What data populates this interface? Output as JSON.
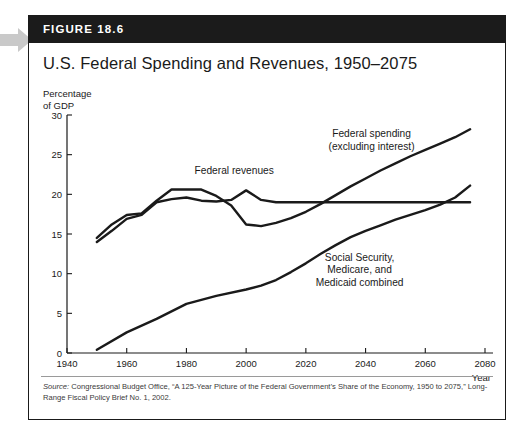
{
  "figure": {
    "badge": "FIGURE 18.6",
    "title": "U.S. Federal Spending and Revenues, 1950–2075",
    "unit_line1": "Percentage",
    "unit_line2": "of GDP",
    "source_prefix": "Source:",
    "source_rest": " Congressional Budget Office, “A 125-Year Picture of the Federal Government’s Share of the Economy, 1950 to 2075,” Long-Range Fiscal Policy Brief No. 1, 2002."
  },
  "chart_data": {
    "type": "line",
    "title": "U.S. Federal Spending and Revenues, 1950–2075",
    "xlabel": "Year",
    "ylabel": "Percentage of GDP",
    "xlim": [
      1940,
      2080
    ],
    "ylim": [
      0,
      30
    ],
    "xticks": [
      1940,
      1960,
      1980,
      2000,
      2020,
      2040,
      2060,
      2080
    ],
    "yticks": [
      0,
      5,
      10,
      15,
      20,
      25,
      30
    ],
    "grid": false,
    "legend": "annotations-on-plot",
    "line_color": "#1a1a1a",
    "series": [
      {
        "name": "Federal spending (excluding interest)",
        "label_line1": "Federal spending",
        "label_line2": "(excluding interest)",
        "label_x": 2042,
        "label_y": 27.2,
        "x": [
          1950,
          1955,
          1960,
          1965,
          1970,
          1975,
          1980,
          1985,
          1990,
          1995,
          2000,
          2005,
          2010,
          2015,
          2020,
          2025,
          2030,
          2035,
          2040,
          2045,
          2050,
          2055,
          2060,
          2065,
          2070,
          2075
        ],
        "y": [
          14.5,
          16.2,
          17.4,
          17.6,
          19.2,
          20.6,
          20.6,
          20.6,
          19.8,
          18.6,
          16.2,
          16.0,
          16.4,
          17.0,
          17.8,
          18.8,
          19.9,
          21.0,
          22.0,
          23.0,
          23.9,
          24.8,
          25.6,
          26.4,
          27.2,
          28.2
        ]
      },
      {
        "name": "Federal revenues",
        "label_line1": "Federal revenues",
        "label_x": 1996,
        "label_y": 22.6,
        "x": [
          1950,
          1955,
          1960,
          1965,
          1970,
          1975,
          1980,
          1985,
          1990,
          1995,
          2000,
          2005,
          2010,
          2020,
          2040,
          2060,
          2075
        ],
        "y": [
          14.0,
          15.4,
          16.9,
          17.4,
          19.0,
          19.4,
          19.6,
          19.2,
          19.1,
          19.3,
          20.5,
          19.3,
          19.0,
          19.0,
          19.0,
          19.0,
          19.0
        ]
      },
      {
        "name": "Social Security, Medicare, and Medicaid combined",
        "label_line1": "Social Security,",
        "label_line2": "Medicare, and",
        "label_line3": "Medicaid combined",
        "label_x": 2038,
        "label_y": 11.6,
        "x": [
          1950,
          1960,
          1970,
          1980,
          1990,
          2000,
          2005,
          2010,
          2015,
          2020,
          2025,
          2030,
          2035,
          2040,
          2045,
          2050,
          2055,
          2060,
          2065,
          2070,
          2075
        ],
        "y": [
          0.4,
          2.6,
          4.3,
          6.2,
          7.2,
          8.0,
          8.5,
          9.2,
          10.2,
          11.3,
          12.5,
          13.6,
          14.6,
          15.4,
          16.1,
          16.8,
          17.4,
          18.0,
          18.7,
          19.6,
          21.1
        ]
      }
    ]
  }
}
